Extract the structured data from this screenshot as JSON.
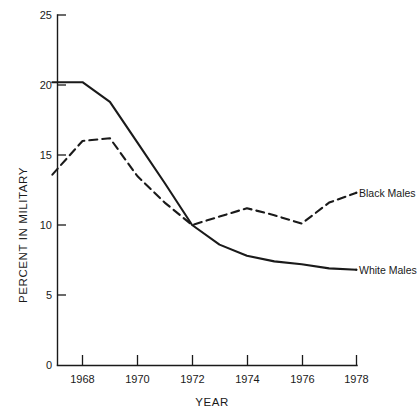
{
  "chart_data": {
    "type": "line",
    "title": "",
    "subtitle": "",
    "xlabel": "YEAR",
    "ylabel": "PERCENT IN MILITARY",
    "xlim": [
      1966.8,
      1978.6
    ],
    "ylim": [
      0,
      25
    ],
    "grid": false,
    "legend_position": "right-inline-labels",
    "xticks": [
      1968,
      1970,
      1972,
      1974,
      1976,
      1978
    ],
    "xtick_labels": [
      "1968",
      "1970",
      "1972",
      "1974",
      "1976",
      "1978"
    ],
    "yticks": [
      0,
      5,
      10,
      15,
      20,
      25
    ],
    "ytick_labels": [
      "0",
      "5",
      "10",
      "15",
      "20",
      "25"
    ],
    "x": [
      1966.9,
      1968,
      1969,
      1970,
      1971,
      1972,
      1973,
      1974,
      1975,
      1976,
      1977,
      1978
    ],
    "series": [
      {
        "name": "Black Males",
        "style": "dashed",
        "color": "#1a1a1a",
        "label": "Black Males",
        "values": [
          13.6,
          16.0,
          16.2,
          13.5,
          11.6,
          10.0,
          10.6,
          11.2,
          10.7,
          10.1,
          11.6,
          12.3
        ]
      },
      {
        "name": "White Males",
        "style": "solid",
        "color": "#1a1a1a",
        "label": "White Males",
        "values": [
          20.2,
          20.2,
          18.8,
          15.9,
          13.0,
          10.0,
          8.6,
          7.8,
          7.4,
          7.2,
          6.9,
          6.8
        ]
      }
    ]
  },
  "axis": {
    "y_title": "PERCENT IN MILITARY",
    "x_title": "YEAR"
  },
  "labels": {
    "black_males": "Black Males",
    "white_males": "White Males"
  },
  "colors": {
    "ink": "#1a1a1a",
    "background": "#ffffff"
  }
}
